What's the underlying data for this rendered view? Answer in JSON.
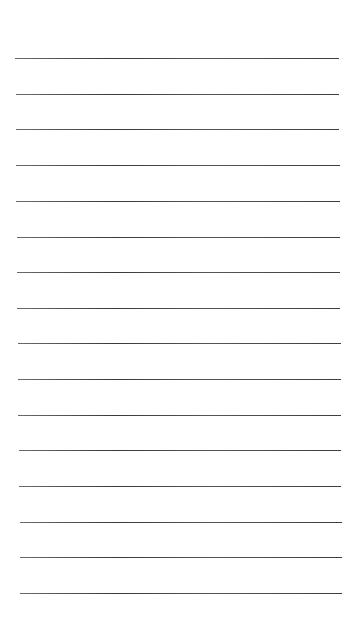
{
  "paper": {
    "background": "#ffffff",
    "line_color": "#444444",
    "line_count": 16,
    "lines": [
      {
        "y": 58,
        "x1": 15,
        "x2": 339
      },
      {
        "y": 94,
        "x1": 16,
        "x2": 339
      },
      {
        "y": 129,
        "x1": 16,
        "x2": 339
      },
      {
        "y": 165,
        "x1": 16,
        "x2": 340
      },
      {
        "y": 201,
        "x1": 16,
        "x2": 340
      },
      {
        "y": 237,
        "x1": 17,
        "x2": 340
      },
      {
        "y": 272,
        "x1": 17,
        "x2": 340
      },
      {
        "y": 308,
        "x1": 17,
        "x2": 340
      },
      {
        "y": 343,
        "x1": 18,
        "x2": 341
      },
      {
        "y": 379,
        "x1": 18,
        "x2": 341
      },
      {
        "y": 415,
        "x1": 18,
        "x2": 341
      },
      {
        "y": 450,
        "x1": 19,
        "x2": 341
      },
      {
        "y": 486,
        "x1": 19,
        "x2": 341
      },
      {
        "y": 522,
        "x1": 20,
        "x2": 342
      },
      {
        "y": 557,
        "x1": 20,
        "x2": 342
      },
      {
        "y": 593,
        "x1": 20,
        "x2": 342
      }
    ]
  }
}
